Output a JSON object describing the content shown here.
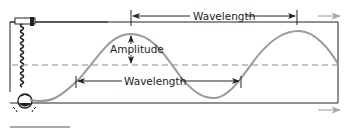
{
  "diagram": {
    "labels": {
      "wavelength_top": "Wavelength",
      "wavelength_bottom": "Wavelength",
      "amplitude": "Amplitude"
    },
    "colors": {
      "wave": "#9a9a9a",
      "frame": "#222222",
      "midline": "#888888",
      "motion_arrow": "#aaaaaa"
    }
  }
}
